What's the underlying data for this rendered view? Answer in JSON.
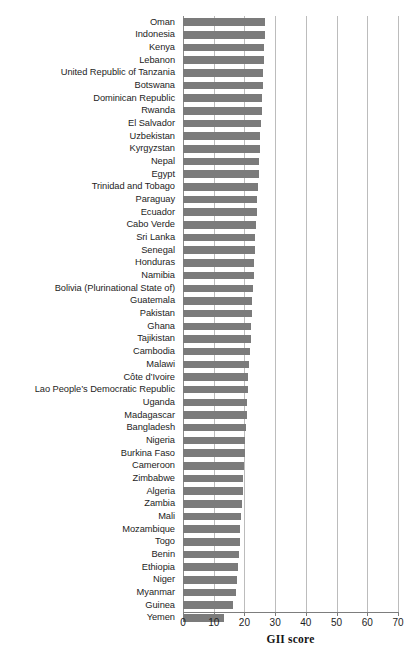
{
  "chart_data": {
    "type": "bar",
    "orientation": "horizontal",
    "title": "",
    "subtitle": "",
    "xlabel": "GII score",
    "ylabel": "",
    "xlim": [
      0,
      70
    ],
    "xticks": [
      0,
      10,
      20,
      30,
      40,
      50,
      60,
      70
    ],
    "grid": true,
    "legend": null,
    "series_color": "#7b7b7b",
    "categories": [
      "Oman",
      "Indonesia",
      "Kenya",
      "Lebanon",
      "United Republic of Tanzania",
      "Botswana",
      "Dominican Republic",
      "Rwanda",
      "El Salvador",
      "Uzbekistan",
      "Kyrgyzstan",
      "Nepal",
      "Egypt",
      "Trinidad and Tobago",
      "Paraguay",
      "Ecuador",
      "Cabo Verde",
      "Sri Lanka",
      "Senegal",
      "Honduras",
      "Namibia",
      "Bolivia (Plurinational State of)",
      "Guatemala",
      "Pakistan",
      "Ghana",
      "Tajikistan",
      "Cambodia",
      "Malawi",
      "Côte d’Ivoire",
      "Lao People’s Democratic Republic",
      "Uganda",
      "Madagascar",
      "Bangladesh",
      "Nigeria",
      "Burkina Faso",
      "Cameroon",
      "Zimbabwe",
      "Algeria",
      "Zambia",
      "Mali",
      "Mozambique",
      "Togo",
      "Benin",
      "Ethiopia",
      "Niger",
      "Myanmar",
      "Guinea",
      "Yemen"
    ],
    "values": [
      26.7,
      26.6,
      26.4,
      26.3,
      26.1,
      25.9,
      25.7,
      25.6,
      25.4,
      25.2,
      25.0,
      24.8,
      24.6,
      24.4,
      24.2,
      24.0,
      23.8,
      23.6,
      23.4,
      23.2,
      23.0,
      22.8,
      22.6,
      22.4,
      22.2,
      22.0,
      21.8,
      21.5,
      21.3,
      21.1,
      20.9,
      20.7,
      20.5,
      20.3,
      20.1,
      19.9,
      19.6,
      19.4,
      19.2,
      19.0,
      18.7,
      18.4,
      18.1,
      17.8,
      17.5,
      17.2,
      16.3,
      13.2
    ]
  },
  "axis": {
    "title": "GII score",
    "tick_labels": [
      "0",
      "10",
      "20",
      "30",
      "40",
      "50",
      "60",
      "70"
    ]
  }
}
